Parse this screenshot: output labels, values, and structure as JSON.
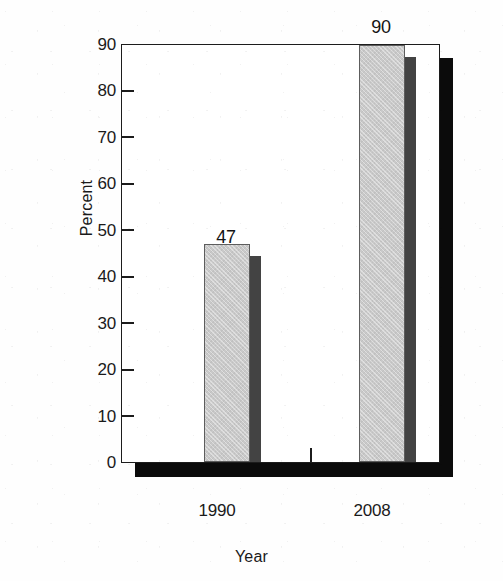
{
  "chart_data": {
    "type": "bar",
    "title": "",
    "xlabel": "Year",
    "ylabel": "Percent",
    "categories": [
      "1990",
      "2008"
    ],
    "values": [
      47,
      90
    ],
    "data_labels": [
      "47",
      "90"
    ],
    "ylim": [
      0,
      90
    ],
    "ytick_labels": [
      "0",
      "10",
      "20",
      "30",
      "40",
      "50",
      "60",
      "70",
      "80",
      "90"
    ],
    "ytick_values": [
      0,
      10,
      20,
      30,
      40,
      50,
      60,
      70,
      80,
      90
    ],
    "grid": false,
    "legend": "none",
    "series": [
      {
        "name": "Percent",
        "values": [
          47,
          90
        ],
        "face_color": "#c9c9c9",
        "side_color": "#434343",
        "edge_color": "#5d5d5d"
      }
    ],
    "style": {
      "frame_color": "#1c1c1c",
      "shadow_color": "#0b0b0b",
      "background": "#ffffff",
      "bar_style": "3d-shadowed",
      "tick_direction": "in"
    }
  }
}
